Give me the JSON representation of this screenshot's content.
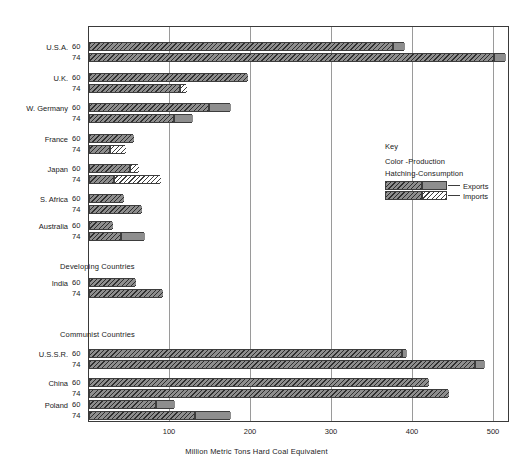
{
  "chart_data": {
    "type": "bar",
    "title": "",
    "xlabel": "Million Metric Tons Hard Coal Equivalent",
    "ylabel": "",
    "xlim": [
      0,
      520
    ],
    "ticks": [
      100,
      200,
      300,
      400,
      500
    ],
    "grid": true,
    "orientation": "horizontal",
    "legend": {
      "title": "Key",
      "note_color": "Color -Production",
      "note_hatch": "Hatching-Consumption",
      "items": [
        {
          "label": "Exports",
          "style": "solid-gray-extension"
        },
        {
          "label": "Imports",
          "style": "light-hatched-extension"
        }
      ]
    },
    "groups": [
      {
        "header": "",
        "countries": [
          {
            "name": "U.S.A.",
            "rows": [
              {
                "year": "60",
                "base": 375,
                "extra": 15,
                "extra_type": "export",
                "total": 390
              },
              {
                "year": "74",
                "base": 500,
                "extra": 15,
                "extra_type": "export",
                "total": 515
              }
            ]
          },
          {
            "name": "U.K.",
            "rows": [
              {
                "year": "60",
                "base": 196,
                "extra": 0,
                "extra_type": "none",
                "total": 196
              },
              {
                "year": "74",
                "base": 112,
                "extra": 8,
                "extra_type": "import",
                "total": 120
              }
            ]
          },
          {
            "name": "W. Germany",
            "rows": [
              {
                "year": "60",
                "base": 148,
                "extra": 27,
                "extra_type": "export",
                "total": 175
              },
              {
                "year": "74",
                "base": 104,
                "extra": 24,
                "extra_type": "export",
                "total": 128
              }
            ]
          },
          {
            "name": "France",
            "rows": [
              {
                "year": "60",
                "base": 54,
                "extra": 0,
                "extra_type": "none",
                "total": 54
              },
              {
                "year": "74",
                "base": 25,
                "extra": 20,
                "extra_type": "import",
                "total": 45
              }
            ]
          },
          {
            "name": "Japan",
            "rows": [
              {
                "year": "60",
                "base": 50,
                "extra": 11,
                "extra_type": "import",
                "total": 61
              },
              {
                "year": "74",
                "base": 30,
                "extra": 58,
                "extra_type": "import",
                "total": 88
              }
            ]
          },
          {
            "name": "S. Africa",
            "rows": [
              {
                "year": "60",
                "base": 42,
                "extra": 0,
                "extra_type": "none",
                "total": 42
              },
              {
                "year": "74",
                "base": 65,
                "extra": 0,
                "extra_type": "none",
                "total": 65
              }
            ]
          },
          {
            "name": "Australia",
            "rows": [
              {
                "year": "60",
                "base": 28,
                "extra": 0,
                "extra_type": "none",
                "total": 28
              },
              {
                "year": "74",
                "base": 38,
                "extra": 30,
                "extra_type": "export",
                "total": 68
              }
            ]
          }
        ]
      },
      {
        "header": "Developing Countries",
        "countries": [
          {
            "name": "India",
            "rows": [
              {
                "year": "60",
                "base": 57,
                "extra": 0,
                "extra_type": "none",
                "total": 57
              },
              {
                "year": "74",
                "base": 90,
                "extra": 0,
                "extra_type": "none",
                "total": 90
              }
            ]
          }
        ]
      },
      {
        "header": "Communist Countries",
        "countries": [
          {
            "name": "U.S.S.R.",
            "rows": [
              {
                "year": "60",
                "base": 386,
                "extra": 7,
                "extra_type": "export",
                "total": 393
              },
              {
                "year": "74",
                "base": 477,
                "extra": 13,
                "extra_type": "export",
                "total": 490
              }
            ]
          },
          {
            "name": "China",
            "rows": [
              {
                "year": "60",
                "base": 420,
                "extra": 0,
                "extra_type": "none",
                "total": 420
              },
              {
                "year": "74",
                "base": 445,
                "extra": 0,
                "extra_type": "none",
                "total": 445
              }
            ]
          },
          {
            "name": "Poland",
            "rows": [
              {
                "year": "60",
                "base": 82,
                "extra": 23,
                "extra_type": "export",
                "total": 105
              },
              {
                "year": "74",
                "base": 130,
                "extra": 45,
                "extra_type": "export",
                "total": 175
              }
            ]
          }
        ]
      }
    ]
  },
  "axis": {
    "tick_labels": [
      "100",
      "200",
      "300",
      "400",
      "500"
    ],
    "title": "Million Metric Tons Hard Coal Equivalent"
  },
  "key": {
    "heading": "Key",
    "line_color": "Color -Production",
    "line_hatch": "Hatching-Consumption",
    "exports_label": "Exports",
    "imports_label": "Imports"
  },
  "colors": {
    "bar_fill": "#8e8e8e",
    "bar_stroke": "#3d3d3d",
    "grid": "#9a9a9a",
    "frame": "#3a3a3a",
    "text": "#1d1d1d",
    "background": "#ffffff"
  }
}
